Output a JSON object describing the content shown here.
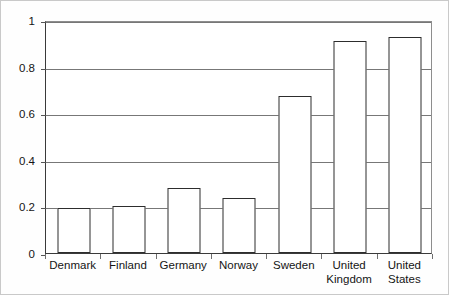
{
  "chart_data": {
    "type": "bar",
    "title": "",
    "subtitle": "",
    "xlabel": "",
    "ylabel": "",
    "categories": [
      "Denmark",
      "Finland",
      "Germany",
      "Norway",
      "Sweden",
      "United Kingdom",
      "United States"
    ],
    "category_labels_wrapped": [
      "Denmark",
      "Finland",
      "Germany",
      "Norway",
      "Sweden",
      "United\nKingdom",
      "United\nStates"
    ],
    "values": [
      0.195,
      0.2,
      0.28,
      0.235,
      0.675,
      0.91,
      0.925
    ],
    "series": [
      {
        "name": "",
        "values": [
          0.195,
          0.2,
          0.28,
          0.235,
          0.675,
          0.91,
          0.925
        ]
      }
    ],
    "ylim": [
      0,
      1
    ],
    "ytick_labels": [
      "0",
      "0.2",
      "0.4",
      "0.6",
      "0.8",
      "1"
    ],
    "ytick_values": [
      0,
      0.2,
      0.4,
      0.6,
      0.8,
      1
    ],
    "grid": true,
    "grid_axis": "y",
    "legend": false,
    "legend_position": "none",
    "bar_fill_color": "#ffffff",
    "bar_border_color": "#2d2d2d",
    "gridline_color": "#777777",
    "axis_color": "#3a3a3a",
    "background_color": "#ffffff"
  }
}
